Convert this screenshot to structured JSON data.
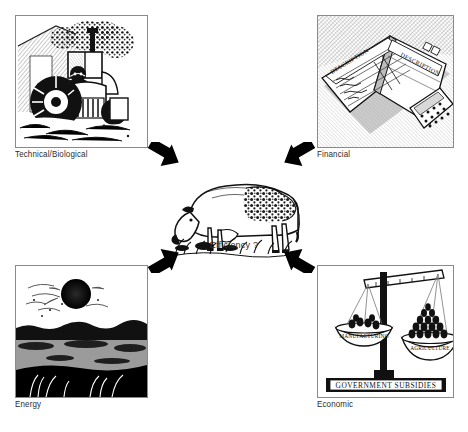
{
  "diagram": {
    "center": {
      "caption": "Efficiency ?",
      "subject": "grazing-dairy-cow"
    },
    "ink_color": "#000000",
    "frame_color": "#8a8a8a",
    "caption_color": "#2b2b2b",
    "panels": [
      {
        "id": "technical",
        "caption": "Technical/Biological",
        "subject": "farmer-driving-tractor",
        "position": "top-left"
      },
      {
        "id": "financial",
        "caption": "Financial",
        "subject": "open-ledger-book-and-calculator",
        "position": "top-right",
        "ledger_headings": [
          "DESCRIPTION",
          "DESCRIPTION"
        ]
      },
      {
        "id": "energy",
        "caption": "Energy",
        "subject": "sun-over-field-horizon",
        "position": "bottom-left"
      },
      {
        "id": "economic",
        "caption": "Economic",
        "subject": "balance-scale-weighing-sectors",
        "position": "bottom-right",
        "scale_left_pan_label": "MANUFACTURING",
        "scale_right_pan_label": "AGRICULTURE",
        "base_label": "GOVERNMENT SUBSIDIES"
      }
    ],
    "arrows": [
      {
        "id": "top-left-arrow",
        "from": "technical",
        "to": "center",
        "direction": "down-right"
      },
      {
        "id": "top-right-arrow",
        "from": "financial",
        "to": "center",
        "direction": "down-left"
      },
      {
        "id": "bottom-left-arrow",
        "from": "energy",
        "to": "center",
        "direction": "up-right"
      },
      {
        "id": "bottom-right-arrow",
        "from": "economic",
        "to": "center",
        "direction": "up-left"
      }
    ]
  }
}
